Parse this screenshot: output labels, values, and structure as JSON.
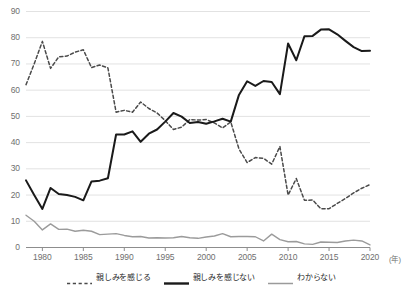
{
  "chart_data": {
    "type": "line",
    "title": "",
    "subtitle": "",
    "xlabel": "年",
    "ylabel": "",
    "xlim": [
      1978,
      2020
    ],
    "ylim": [
      0,
      90
    ],
    "grid": true,
    "grid_axis": "y",
    "legend_position": "bottom",
    "x": [
      1978,
      1979,
      1980,
      1981,
      1982,
      1983,
      1984,
      1985,
      1986,
      1987,
      1988,
      1989,
      1990,
      1991,
      1992,
      1993,
      1994,
      1995,
      1996,
      1997,
      1998,
      1999,
      2000,
      2001,
      2002,
      2003,
      2004,
      2005,
      2006,
      2007,
      2008,
      2009,
      2010,
      2011,
      2012,
      2013,
      2014,
      2015,
      2016,
      2017,
      2018,
      2019,
      2020
    ],
    "xticks": [
      1980,
      1985,
      1990,
      1995,
      2000,
      2005,
      2010,
      2015,
      2020
    ],
    "xtick_labels": [
      "1980",
      "1985",
      "1990",
      "1995",
      "2000",
      "2005",
      "2010",
      "2015",
      "2020"
    ],
    "yticks": [
      0,
      10,
      20,
      30,
      40,
      50,
      60,
      70,
      80,
      90
    ],
    "ytick_labels": [
      "0",
      "10",
      "20",
      "30",
      "40",
      "50",
      "60",
      "70",
      "80",
      "90"
    ],
    "series": [
      {
        "name": "親しみを感じる",
        "style": "dashed",
        "color": "#4a4a4a",
        "values": [
          62.1,
          70.0,
          78.6,
          68.3,
          72.7,
          73.0,
          74.5,
          75.4,
          68.6,
          69.6,
          68.5,
          51.6,
          52.3,
          51.6,
          55.5,
          53.0,
          51.3,
          48.4,
          45.0,
          45.9,
          48.8,
          48.6,
          48.8,
          47.5,
          45.6,
          47.9,
          37.6,
          32.4,
          34.3,
          34.0,
          31.8,
          38.5,
          20.0,
          26.3,
          18.0,
          18.1,
          14.8,
          14.8,
          16.8,
          18.7,
          20.8,
          22.6,
          24.0
        ],
        "last_value": 24.0,
        "peak_value": 78.6,
        "peak_year": 1980
      },
      {
        "name": "親しみを感じない",
        "style": "solid",
        "color": "#1a1a1a",
        "values": [
          25.6,
          20.0,
          14.7,
          22.7,
          20.4,
          20.0,
          19.3,
          18.0,
          25.2,
          25.5,
          26.4,
          43.1,
          43.1,
          44.3,
          40.3,
          43.4,
          45.0,
          48.0,
          51.3,
          49.9,
          47.5,
          47.9,
          47.2,
          48.1,
          49.1,
          48.0,
          58.2,
          63.4,
          61.6,
          63.5,
          63.1,
          58.5,
          77.8,
          71.4,
          80.6,
          80.7,
          83.1,
          83.2,
          81.3,
          78.8,
          76.4,
          74.9,
          75.0
        ],
        "last_value": 75.0,
        "peak_value": 83.2,
        "peak_year": 2015
      },
      {
        "name": "わからない",
        "style": "solid",
        "color": "#9b9b9b",
        "values": [
          12.3,
          10.0,
          6.7,
          9.0,
          6.9,
          7.0,
          6.2,
          6.6,
          6.2,
          4.9,
          5.1,
          5.3,
          4.6,
          4.1,
          4.2,
          3.6,
          3.7,
          3.6,
          3.7,
          4.2,
          3.7,
          3.5,
          4.0,
          4.4,
          5.3,
          4.1,
          4.2,
          4.2,
          4.1,
          2.5,
          5.1,
          3.0,
          2.2,
          2.3,
          1.4,
          1.2,
          2.1,
          2.0,
          1.9,
          2.5,
          2.8,
          2.5,
          1.0
        ]
      }
    ]
  },
  "axis": {
    "x_unit_label": "(年)"
  },
  "legend": {
    "items": [
      {
        "label": "親しみを感じる",
        "swatch": "dashed-dark"
      },
      {
        "label": "親しみを感じない",
        "swatch": "solid-black"
      },
      {
        "label": "わからない",
        "swatch": "solid-gray"
      }
    ]
  }
}
